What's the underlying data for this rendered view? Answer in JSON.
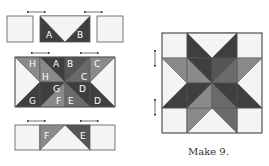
{
  "colors": {
    "light": "#f4f4f4",
    "medium": "#8a8a8a",
    "medium_dark": "#6b6b6b",
    "dark": "#3f3f3f",
    "outline": "#555555"
  },
  "left_diagram": {
    "top_row": {
      "labels": [
        "A",
        "B"
      ]
    },
    "middle_row": {
      "labels": [
        "H",
        "A",
        "B",
        "C",
        "H",
        "C",
        "G",
        "D",
        "G",
        "F",
        "E",
        "D"
      ]
    },
    "bottom_row": {
      "labels": [
        "F",
        "E"
      ]
    },
    "pressing_arrows": "horizontal double-headed arrows above seams"
  },
  "right_diagram": {
    "description": "Eight-pointed star quilt block, 4x4 grid",
    "pressing_arrows": "vertical double-headed arrows at left row seams"
  },
  "caption": "Make 9."
}
